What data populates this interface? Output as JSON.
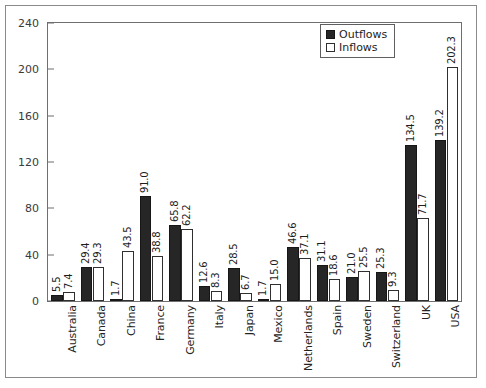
{
  "chart_data": {
    "type": "bar",
    "title": "",
    "xlabel": "",
    "ylabel": "",
    "ylim": [
      0,
      240
    ],
    "yticks": [
      0,
      40,
      80,
      120,
      160,
      200,
      240
    ],
    "grid": false,
    "legend_position": "top-right",
    "categories": [
      "Australia",
      "Canada",
      "China",
      "France",
      "Germany",
      "Italy",
      "Japan",
      "Mexico",
      "Netherlands",
      "Spain",
      "Sweden",
      "Switzerland",
      "UK",
      "USA"
    ],
    "series": [
      {
        "name": "Outflows",
        "color": "#262626",
        "values": [
          5.5,
          29.4,
          1.7,
          91.0,
          65.8,
          12.6,
          28.5,
          1.7,
          46.6,
          31.1,
          21.0,
          25.3,
          134.5,
          139.2
        ],
        "labels": [
          "5.5",
          "29.4",
          "1.7",
          "91.0",
          "65.8",
          "12.6",
          "28.5",
          "1.7",
          "46.6",
          "31.1",
          "21.0",
          "25.3",
          "134.5",
          "139.2"
        ]
      },
      {
        "name": "Inflows",
        "color": "#ffffff",
        "values": [
          7.4,
          29.3,
          43.5,
          38.8,
          62.2,
          8.3,
          6.7,
          15.0,
          37.1,
          18.6,
          25.5,
          9.3,
          71.7,
          202.3
        ],
        "labels": [
          "7.4",
          "29.3",
          "43.5",
          "38.8",
          "62.2",
          "8.3",
          "6.7",
          "15.0",
          "37.1",
          "18.6",
          "25.5",
          "9.3",
          "71.7",
          "202.3"
        ]
      }
    ]
  },
  "legend": {
    "items": [
      {
        "label": "Outflows",
        "swatch": "filled-dark-square"
      },
      {
        "label": "Inflows",
        "swatch": "open-white-square"
      }
    ]
  }
}
